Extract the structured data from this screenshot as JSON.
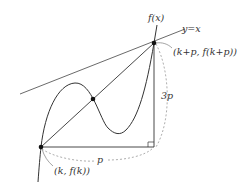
{
  "diagram": {
    "labels": {
      "curve": "f(x)",
      "line": "y=x",
      "point_top": "(k+p, f(k+p))",
      "point_bottom": "(k, f(k))",
      "horizontal_length": "p",
      "vertical_length": "3p"
    },
    "colors": {
      "stroke": "#333333",
      "dashed": "#999999",
      "point": "#111111",
      "background": "#ffffff"
    },
    "points": [
      {
        "name": "bottom-left",
        "label": "(k, f(k))",
        "x": 41,
        "y": 147
      },
      {
        "name": "middle-intersection",
        "label": "",
        "x": 93,
        "y": 99
      },
      {
        "name": "top-right",
        "label": "(k+p, f(k+p))",
        "x": 154,
        "y": 43
      }
    ]
  }
}
